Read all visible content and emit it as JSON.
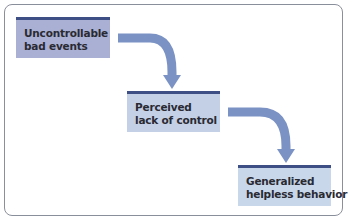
{
  "diagram": {
    "steps": [
      {
        "lines": [
          "Uncontrollable",
          "bad events"
        ]
      },
      {
        "lines": [
          "Perceived",
          "lack of control"
        ]
      },
      {
        "lines": [
          "Generalized",
          "helpless behavior"
        ]
      }
    ],
    "colors": {
      "box1_fill": "#a9b0d3",
      "box2_fill": "#c3d0e6",
      "box3_fill": "#c8d7ea",
      "box_top_border": "#3e4f86",
      "arrow": "#7b92c4",
      "frame_border": "#8a8f9c"
    }
  }
}
